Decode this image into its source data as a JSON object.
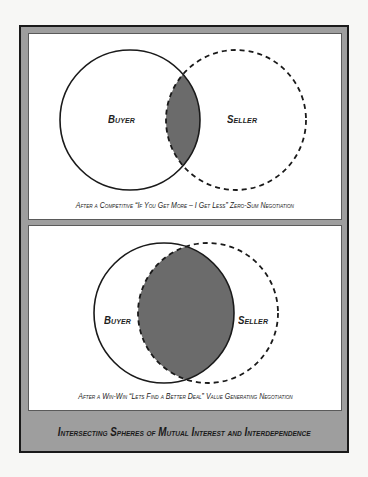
{
  "diagram": {
    "title": "Intersecting Spheres of Mutual Interest and Interdependence",
    "colors": {
      "frame_border": "#1a1a1a",
      "frame_fill": "#9e9e9e",
      "panel_fill": "#ffffff",
      "overlap_fill": "#6b6b6b",
      "stroke": "#1a1a1a"
    },
    "panels": [
      {
        "buyer_label": "Buyer",
        "seller_label": "Seller",
        "caption": "After a Competitive “If You Get More – I Get Less” Zero-Sum Negotiation",
        "overlap": "small"
      },
      {
        "buyer_label": "Buyer",
        "seller_label": "Seller",
        "caption": "After a Win-Win “Lets Find a Better Deal” Value Generating Negotiation",
        "overlap": "large"
      }
    ]
  }
}
